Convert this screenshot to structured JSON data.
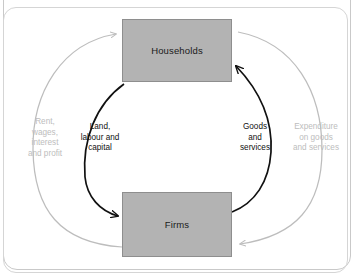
{
  "diagram": {
    "nodes": [
      {
        "id": "households",
        "label": "Households"
      },
      {
        "id": "firms",
        "label": "Firms"
      }
    ],
    "flows": [
      {
        "id": "rent-wages",
        "label": "Rent,\nwages,\ninterest\nand profit",
        "from": "firms",
        "to": "households",
        "side": "left",
        "ring": "outer",
        "color": "#bdbdbd"
      },
      {
        "id": "factors",
        "label": "Land,\nlabour and\ncapital",
        "from": "households",
        "to": "firms",
        "side": "left",
        "ring": "inner",
        "color": "#111111"
      },
      {
        "id": "goods-services",
        "label": "Goods\nand\nservices",
        "from": "firms",
        "to": "households",
        "side": "right",
        "ring": "inner",
        "color": "#111111"
      },
      {
        "id": "expenditure",
        "label": "Expenditure\non goods\nand services",
        "from": "households",
        "to": "firms",
        "side": "right",
        "ring": "outer",
        "color": "#bdbdbd"
      }
    ],
    "colors": {
      "box_fill": "#b3b3b3",
      "box_border": "#8e8e8e",
      "inner_flow": "#111111",
      "outer_flow": "#bdbdbd",
      "frame_border": "#c9c9c9",
      "background": "#ffffff"
    }
  }
}
